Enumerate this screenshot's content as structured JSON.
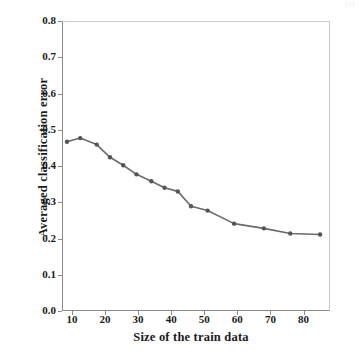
{
  "figure": {
    "caption_fragment": "(b)",
    "background_color": "#ffffff",
    "line_color": "#6b6b6b",
    "marker_color": "#555555",
    "axis_color": "#8a8a8a",
    "text_color": "#1a1a1a"
  },
  "chart_data": {
    "type": "line",
    "title": "",
    "xlabel": "Size of the train data",
    "ylabel": "Averaged classification error",
    "xlim": [
      7,
      88
    ],
    "ylim": [
      0.0,
      0.8
    ],
    "grid": false,
    "legend": null,
    "xticks": [
      "10",
      "20",
      "30",
      "40",
      "50",
      "60",
      "70",
      "80"
    ],
    "xtick_values": [
      10,
      20,
      30,
      40,
      50,
      60,
      70,
      80
    ],
    "yticks": [
      "0.0",
      "0.1",
      "0.2",
      "0.3",
      "0.4",
      "0.5",
      "0.6",
      "0.7",
      "0.8"
    ],
    "ytick_values": [
      0.0,
      0.1,
      0.2,
      0.3,
      0.4,
      0.5,
      0.6,
      0.7,
      0.8
    ],
    "series": [
      {
        "name": "Averaged classification error",
        "marker": "filled-circle",
        "x": [
          8.5,
          12.5,
          17.5,
          21.5,
          25.5,
          29.5,
          34,
          38,
          42,
          46,
          51,
          59,
          68,
          76,
          85
        ],
        "values": [
          0.467,
          0.477,
          0.459,
          0.424,
          0.402,
          0.377,
          0.358,
          0.34,
          0.33,
          0.289,
          0.277,
          0.241,
          0.228,
          0.214,
          0.211
        ]
      }
    ]
  }
}
